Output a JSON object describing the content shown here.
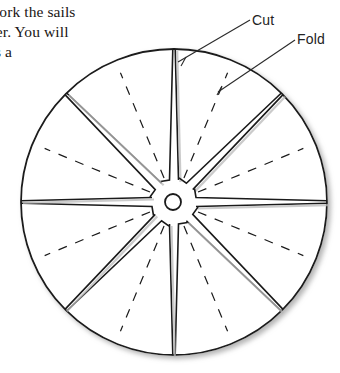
{
  "page": {
    "background": "#ffffff",
    "ink_color": "#1a1a1a",
    "text_color": "#1a1614"
  },
  "body_text": {
    "lines": [
      "work the sails",
      "her. You will",
      "as a"
    ],
    "joined": "work the sails\nher. You will\nas a",
    "note": "partial paragraph clipped at left page margin"
  },
  "labels": {
    "cut": "Cut",
    "fold": "Fold"
  },
  "diagram": {
    "name": "pinwheel-sail-cutting-template",
    "shape": "circle",
    "center": {
      "x": 174,
      "y": 202
    },
    "radius": 153,
    "hub": {
      "x": 173,
      "y": 202,
      "radius": 8
    },
    "cut_count": 8,
    "fold_count": 8,
    "cut_style": "solid",
    "fold_style": "dashed",
    "cut_angles_deg": [
      270,
      315,
      0,
      45,
      90,
      135,
      180,
      225
    ],
    "fold_angles_deg": [
      292.5,
      337.5,
      22.5,
      67.5,
      112.5,
      157.5,
      202.5,
      247.5
    ],
    "cut_inner_radius": 22,
    "fold_inner_radius": 26,
    "fold_outer_radius": 140,
    "slot_half_width_px": 4.5,
    "hook_length_px": 9,
    "outline_width": 1.8,
    "cut_width": 1.6,
    "fold_width": 1.2,
    "fold_dash": "9 9",
    "shadow_color": "#b9b9b9"
  },
  "leaders": {
    "cut": {
      "from": {
        "x": 250,
        "y": 20
      },
      "to": {
        "x": 178,
        "y": 62
      }
    },
    "fold": {
      "from": {
        "x": 295,
        "y": 40
      },
      "to": {
        "x": 218,
        "y": 92
      }
    },
    "tick_cut": {
      "x": 186,
      "y": 57
    },
    "tick_fold": {
      "x": 222,
      "y": 86
    }
  }
}
